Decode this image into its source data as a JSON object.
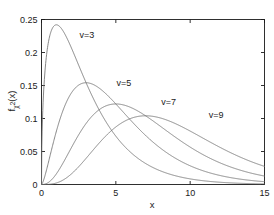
{
  "chart_data": {
    "type": "line",
    "title": "",
    "subtitle": "",
    "xlabel": "x",
    "ylabel": "f_χ2(x)",
    "ylabel_parts": {
      "base": "f",
      "subscript": "χ",
      "subscript_exp": "2",
      "arg": "(x)"
    },
    "xlim": [
      0,
      15
    ],
    "ylim": [
      0,
      0.25
    ],
    "xticks": [
      0,
      5,
      10,
      15
    ],
    "xticklabels": [
      "0",
      "5",
      "10",
      "15"
    ],
    "yticks": [
      0,
      0.05,
      0.1,
      0.15,
      0.2,
      0.25
    ],
    "yticklabels": [
      "0",
      "0.05",
      "0.1",
      "0.15",
      "0.2",
      "0.25"
    ],
    "grid": false,
    "legend_position": "inline-annotations",
    "line_color": "#707070",
    "axis_color": "#1a1a1a",
    "background": "#ffffff",
    "annotations": [
      {
        "text": "v=3",
        "x": 2.55,
        "y": 0.2265
      },
      {
        "text": "v=5",
        "x": 5.05,
        "y": 0.1545
      },
      {
        "text": "v=7",
        "x": 8.05,
        "y": 0.1245
      },
      {
        "text": "v=9",
        "x": 11.25,
        "y": 0.1055
      }
    ],
    "series": [
      {
        "name": "v=3",
        "label": "ν=3",
        "dof": 3,
        "peak_x": 1.0,
        "peak_y": 0.242,
        "x": [
          0,
          0.1,
          0.2,
          0.3,
          0.4,
          0.5,
          0.6,
          0.7,
          0.8,
          0.9,
          1,
          1.2,
          1.4,
          1.6,
          1.8,
          2,
          2.25,
          2.5,
          2.75,
          3,
          3.5,
          4,
          4.5,
          5,
          5.5,
          6,
          6.5,
          7,
          7.5,
          8,
          8.5,
          9,
          9.5,
          10,
          10.5,
          11,
          11.5,
          12,
          12.5,
          13,
          13.5,
          14,
          14.5,
          15
        ],
        "y": [
          0,
          0.12,
          0.1614,
          0.1868,
          0.2034,
          0.2144,
          0.2216,
          0.2261,
          0.2286,
          0.2296,
          0.242,
          0.2183,
          0.2062,
          0.1918,
          0.1773,
          0.162,
          0.1441,
          0.1274,
          0.112,
          0.098,
          0.0747,
          0.0564,
          0.0423,
          0.0316,
          0.0235,
          0.0175,
          0.0129,
          0.0096,
          0.0071,
          0.0052,
          0.0038,
          0.0028,
          0.0021,
          0.0015,
          0.0011,
          0.0008,
          0.0006,
          0.0004,
          0.0003,
          0.0002,
          0.00016,
          0.00012,
          9e-05,
          0.0027
        ]
      },
      {
        "name": "v=5",
        "label": "ν=5",
        "dof": 5,
        "peak_x": 3.0,
        "peak_y": 0.1542,
        "x": [
          0,
          0.25,
          0.5,
          0.75,
          1,
          1.5,
          2,
          2.5,
          3,
          3.5,
          4,
          4.5,
          5,
          5.5,
          6,
          6.5,
          7,
          7.5,
          8,
          8.5,
          9,
          9.5,
          10,
          10.5,
          11,
          11.5,
          12,
          12.5,
          13,
          13.5,
          14,
          14.5,
          15
        ],
        "y": [
          0,
          0.018,
          0.0439,
          0.0702,
          0.0927,
          0.1241,
          0.1404,
          0.1476,
          0.1542,
          0.1469,
          0.1391,
          0.1297,
          0.1166,
          0.1033,
          0.0901,
          0.0779,
          0.0667,
          0.0568,
          0.0481,
          0.0404,
          0.0338,
          0.0282,
          0.0234,
          0.0193,
          0.0159,
          0.0131,
          0.0107,
          0.0088,
          0.0071,
          0.0058,
          0.0047,
          0.0038,
          0.0077
        ]
      },
      {
        "name": "v=7",
        "label": "ν=7",
        "dof": 7,
        "peak_x": 5.0,
        "peak_y": 0.122,
        "x": [
          0,
          0.5,
          1,
          1.5,
          2,
          2.5,
          3,
          3.5,
          4,
          4.5,
          5,
          5.5,
          6,
          6.5,
          7,
          7.5,
          8,
          8.5,
          9,
          9.5,
          10,
          10.5,
          11,
          11.5,
          12,
          12.5,
          13,
          13.5,
          14,
          14.5,
          15
        ],
        "y": [
          0,
          0.004,
          0.0153,
          0.0307,
          0.0469,
          0.0622,
          0.0755,
          0.0863,
          0.0944,
          0.1,
          0.122,
          0.1185,
          0.1135,
          0.1056,
          0.0966,
          0.0869,
          0.0772,
          0.0677,
          0.0588,
          0.0506,
          0.0432,
          0.0366,
          0.0308,
          0.0258,
          0.0215,
          0.0178,
          0.0147,
          0.0121,
          0.0099,
          0.0081,
          0.0166
        ]
      },
      {
        "name": "v=9",
        "label": "ν=9",
        "dof": 9,
        "peak_x": 7.0,
        "peak_y": 0.106,
        "x": [
          0,
          0.5,
          1,
          1.5,
          2,
          2.5,
          3,
          3.5,
          4,
          4.5,
          5,
          5.5,
          6,
          6.5,
          7,
          7.5,
          8,
          8.5,
          9,
          9.5,
          10,
          10.5,
          11,
          11.5,
          12,
          12.5,
          13,
          13.5,
          14,
          14.5,
          15
        ],
        "y": [
          0,
          0.0007,
          0.0039,
          0.0101,
          0.0189,
          0.0292,
          0.04,
          0.0504,
          0.0598,
          0.0677,
          0.09,
          0.0966,
          0.102,
          0.105,
          0.106,
          0.1038,
          0.1,
          0.0949,
          0.0889,
          0.0824,
          0.0755,
          0.0687,
          0.062,
          0.0556,
          0.0495,
          0.0439,
          0.0387,
          0.034,
          0.0297,
          0.0258,
          0.0277
        ]
      }
    ]
  }
}
